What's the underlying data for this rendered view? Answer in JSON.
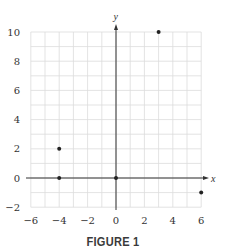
{
  "chart_data": {
    "type": "scatter",
    "title": "",
    "caption": "FIGURE 1",
    "xlabel": "x",
    "ylabel": "y",
    "xlim": [
      -6,
      6
    ],
    "ylim": [
      -2,
      10
    ],
    "x_ticks": [
      -6,
      -4,
      -2,
      0,
      2,
      4,
      6
    ],
    "y_ticks": [
      -2,
      0,
      2,
      4,
      6,
      8,
      10
    ],
    "grid": true,
    "grid_step": 1,
    "legend": null,
    "series": [
      {
        "name": "points",
        "points": [
          {
            "x": -4,
            "y": 2
          },
          {
            "x": -4,
            "y": 0
          },
          {
            "x": 0,
            "y": 0
          },
          {
            "x": 3,
            "y": 10
          },
          {
            "x": 6,
            "y": -1
          }
        ]
      }
    ],
    "colors": {
      "grid": "#dcdcdc",
      "axis": "#333333",
      "point": "#222222"
    }
  }
}
